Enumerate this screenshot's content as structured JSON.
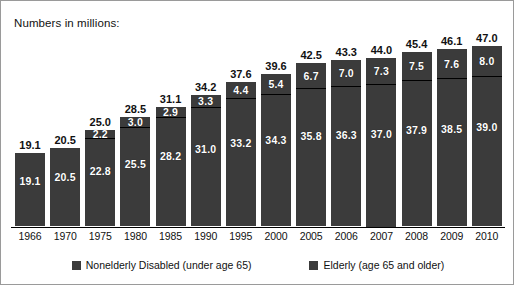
{
  "caption": "Numbers in millions:",
  "legend": {
    "items": [
      {
        "label": "Nonelderly Disabled (under age 65)",
        "color": "#3b3b3b",
        "icon": "legend-swatch-icon"
      },
      {
        "label": "Elderly (age 65 and older)",
        "color": "#3b3b3b",
        "icon": "legend-swatch-icon"
      }
    ]
  },
  "chart_data": {
    "type": "bar",
    "subtype": "stacked-bar",
    "title": "Numbers in millions:",
    "xlabel": "",
    "ylabel": "",
    "grid": false,
    "legend_position": "bottom-center",
    "ylim": [
      0,
      47.0
    ],
    "categories": [
      "1966",
      "1970",
      "1975",
      "1980",
      "1985",
      "1990",
      "1995",
      "2000",
      "2005",
      "2006",
      "2007",
      "2008",
      "2009",
      "2010"
    ],
    "series": [
      {
        "name": "Nonelderly Disabled (under age 65)",
        "values": [
          19.1,
          20.5,
          22.8,
          25.5,
          28.2,
          31.0,
          33.2,
          34.3,
          35.8,
          36.3,
          37.0,
          37.9,
          38.5,
          39.0
        ]
      },
      {
        "name": "Elderly (age 65 and older)",
        "values": [
          null,
          null,
          2.2,
          3.0,
          2.9,
          3.3,
          4.4,
          5.4,
          6.7,
          7.0,
          7.3,
          7.5,
          7.6,
          8.0
        ]
      }
    ],
    "totals": [
      19.1,
      20.5,
      25.0,
      28.5,
      31.1,
      34.2,
      37.6,
      39.6,
      42.5,
      43.3,
      44.0,
      45.4,
      46.1,
      47.0
    ],
    "labels": {
      "totals": [
        "19.1",
        "20.5",
        "25.0",
        "28.5",
        "31.1",
        "34.2",
        "37.6",
        "39.6",
        "42.5",
        "43.3",
        "44.0",
        "45.4",
        "46.1",
        "47.0"
      ],
      "nonelderly": [
        "19.1",
        "20.5",
        "22.8",
        "25.5",
        "28.2",
        "31.0",
        "33.2",
        "34.3",
        "35.8",
        "36.3",
        "37.0",
        "37.9",
        "38.5",
        "39.0"
      ],
      "elderly": [
        "",
        "",
        "2.2",
        "3.0",
        "2.9",
        "3.3",
        "4.4",
        "5.4",
        "6.7",
        "7.0",
        "7.3",
        "7.5",
        "7.6",
        "8.0"
      ]
    },
    "colors": {
      "bar": "#3b3b3b",
      "divider": "#000000",
      "value_text": "#ffffff",
      "total_text": "#111111"
    }
  }
}
